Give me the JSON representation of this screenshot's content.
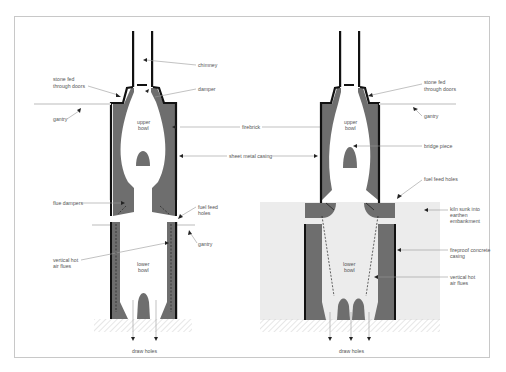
{
  "figure": {
    "type": "cross-section diagram",
    "colors": {
      "firebrick": "#6e6e6e",
      "casing": "#111111",
      "embankment": "#ececec",
      "ground_hatch": "#bdbdbd",
      "leader_line": "#999999",
      "frame": "#c8c8c8"
    }
  },
  "left_kiln": {
    "labels": {
      "chimney": "chimney",
      "stone_fed_1": "stone fed",
      "stone_fed_2": "through doors",
      "damper": "damper",
      "gantry_top": "gantry",
      "upper_bowl_1": "upper",
      "upper_bowl_2": "bowl",
      "flue_dampers": "flue dampers",
      "fuel_feed_1": "fuel feed",
      "fuel_feed_2": "holes",
      "gantry_mid": "gantry",
      "vertical_flues_1": "vertical hot",
      "vertical_flues_2": "air flues",
      "lower_bowl_1": "lower",
      "lower_bowl_2": "bowl",
      "draw_holes": "draw holes"
    }
  },
  "shared": {
    "firebrick": "firebrick",
    "sheet_metal_casing": "sheet metal casing"
  },
  "right_kiln": {
    "labels": {
      "stone_fed_1": "stone fed",
      "stone_fed_2": "through doors",
      "gantry": "gantry",
      "upper_bowl_1": "upper",
      "upper_bowl_2": "bowl",
      "bridge_piece": "bridge piece",
      "fuel_feed_holes": "fuel feed holes",
      "kiln_sunk_1": "kiln sunk into",
      "kiln_sunk_2": "earthen",
      "kiln_sunk_3": "embankment",
      "fireproof_1": "fireproof concrete",
      "fireproof_2": "casing",
      "vertical_flues_1": "vertical hot",
      "vertical_flues_2": "air flues",
      "lower_bowl_1": "lower",
      "lower_bowl_2": "bowl",
      "draw_holes": "draw holes"
    }
  }
}
